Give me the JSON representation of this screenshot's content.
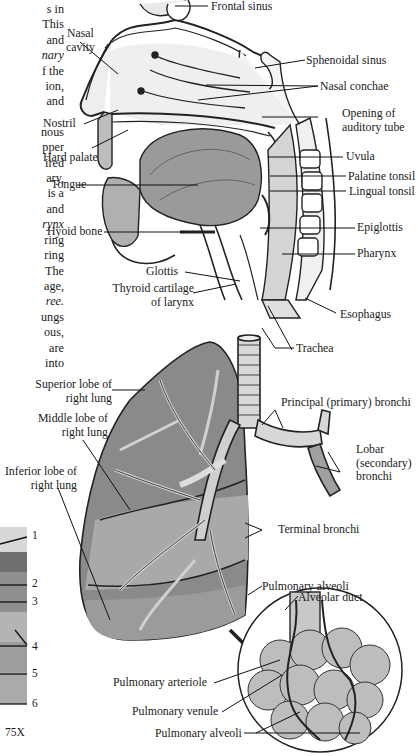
{
  "body_text": {
    "lines": [
      "s in",
      "This",
      "and",
      "nary",
      "f the",
      "ion,",
      "and",
      "",
      "nous",
      "pper",
      "ired",
      "ary,",
      "is a",
      "and",
      "rynx",
      "ring",
      "ring",
      "The",
      "age,",
      "ree.",
      "ungs",
      "ous,",
      "are",
      "into"
    ],
    "italic_lines": [
      3,
      14,
      19
    ]
  },
  "head_labels": {
    "frontal_sinus": "Frontal sinus",
    "nasal_cavity": "Nasal\ncavity",
    "nasal_cavity_l1": "Nasal",
    "nasal_cavity_l2": "cavity",
    "sphenoidal_sinus": "Sphenoidal sinus",
    "nasal_conchae": "Nasal conchae",
    "opening_auditory_l1": "Opening of",
    "opening_auditory_l2": "auditory tube",
    "nostril": "Nostril",
    "hard_palate": "Hard palate",
    "uvula": "Uvula",
    "palatine_tonsil": "Palatine tonsil",
    "tongue": "Tongue",
    "lingual_tonsil": "Lingual tonsil",
    "hyoid_bone": "Hyoid bone",
    "epiglottis": "Epiglottis",
    "pharynx": "Pharynx",
    "glottis": "Glottis",
    "thyroid_l1": "Thyroid cartilage",
    "thyroid_l2": "of larynx",
    "esophagus": "Esophagus"
  },
  "lung_labels": {
    "trachea": "Trachea",
    "superior_l1": "Superior lobe of",
    "superior_l2": "right lung",
    "principal_bronchi": "Principal (primary) bronchi",
    "middle_l1": "Middle lobe of",
    "middle_l2": "right lung",
    "lobar_l1": "Lobar",
    "lobar_l2": "(secondary)",
    "lobar_l3": "bronchi",
    "inferior_l1": "Inferior lobe of",
    "inferior_l2": "right lung",
    "terminal_bronchi": "Terminal bronchi",
    "pulmonary_alveoli_top": "Pulmonary alveoli",
    "alveolar_duct": "Alveolar duct",
    "pulmonary_arteriole": "Pulmonary arteriole",
    "pulmonary_venule": "Pulmonary venule",
    "pulmonary_alveoli_bottom": "Pulmonary alveoli"
  },
  "micrograph": {
    "numbers": [
      "1",
      "2",
      "3",
      "4",
      "5",
      "6"
    ],
    "magnification": "75X"
  }
}
